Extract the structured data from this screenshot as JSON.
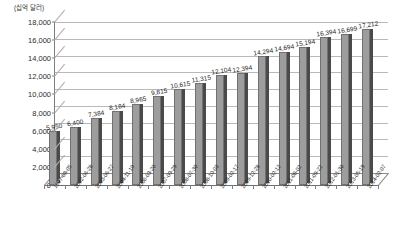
{
  "chart_data": {
    "type": "bar",
    "title": "",
    "subtitle": "",
    "unit_label": "(십억 달러)",
    "xlabel": "",
    "ylabel": "",
    "ylim": [
      0,
      18000
    ],
    "yticks": [
      "18,000",
      "16,000",
      "14,000",
      "12,000",
      "10,000",
      "8,000",
      "6,000",
      "4,000",
      "2,000",
      "0"
    ],
    "ytick_values": [
      18000,
      16000,
      14000,
      12000,
      10000,
      8000,
      6000,
      4000,
      2000,
      0
    ],
    "grid": true,
    "legend": "none",
    "style": "3d-perspective",
    "categories": [
      "1997-08-05",
      "2002-06-28",
      "2003-06-27",
      "2004-11-19",
      "2006-03-20",
      "2007-09-29",
      "2008-07-30",
      "2008-10-03",
      "2009-02-17",
      "2009-12-28",
      "2010-02-12",
      "2011-08-02",
      "2011-09-22",
      "2012-01-30",
      "2013-05-19",
      "2014-02-07"
    ],
    "values": [
      5950,
      6400,
      7384,
      8184,
      8965,
      9815,
      10615,
      11315,
      12104,
      12394,
      14294,
      14694,
      15194,
      16394,
      16699,
      17212
    ],
    "value_labels": [
      "5,950",
      "6,400",
      "7,384",
      "8,184",
      "8,965",
      "9,815",
      "10,615",
      "11,315",
      "12,104",
      "12,394",
      "14,294",
      "14,694",
      "15,194",
      "16,394",
      "16,699",
      "17,212"
    ],
    "colors": {
      "bar_face": "#9d9d9d",
      "bar_edge": "#717171",
      "bar_side": "#4a4a4a",
      "gridline": "#b9b9b9",
      "axis": "#7d7d7d",
      "text": "#2b2b2b",
      "background": "#ffffff"
    }
  }
}
